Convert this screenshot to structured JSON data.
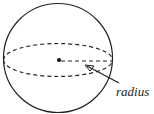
{
  "diagram": {
    "type": "sphere-with-radius",
    "labels": {
      "radius": "radius"
    },
    "colors": {
      "stroke": "#222222",
      "background": "#ffffff"
    }
  }
}
